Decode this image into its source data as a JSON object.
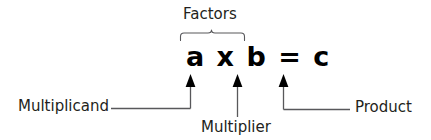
{
  "diagram": {
    "background_color": "#ffffff",
    "stroke_color": "#58585b",
    "text_color": "#231f20",
    "equation_color": "#000000",
    "equation": {
      "text": "a x b = c",
      "multiplicand": "a",
      "operator": "x",
      "multiplier": "b",
      "equals": "=",
      "product": "c"
    },
    "labels": {
      "factors": "Factors",
      "multiplicand": "Multiplicand",
      "multiplier": "Multiplier",
      "product": "Product"
    },
    "annotations": {
      "brace": "curly-brace-pointing-down",
      "arrow_count": 3,
      "arrow_targets": [
        "a",
        "b",
        "c"
      ]
    }
  }
}
